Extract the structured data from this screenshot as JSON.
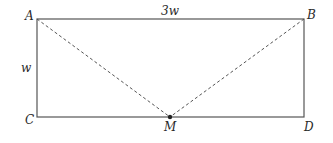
{
  "diagram": {
    "type": "geometry-rectangle",
    "colors": {
      "stroke": "#555555",
      "dashed": "#555555",
      "text": "#2a2a2a",
      "background": "#ffffff"
    },
    "rectangle": {
      "x1": 37,
      "y1": 19,
      "x2": 304,
      "y2": 117
    },
    "points": {
      "A": {
        "label": "A",
        "x": 37,
        "y": 19
      },
      "B": {
        "label": "B",
        "x": 304,
        "y": 19
      },
      "C": {
        "label": "C",
        "x": 37,
        "y": 117
      },
      "D": {
        "label": "D",
        "x": 304,
        "y": 117
      },
      "M": {
        "label": "M",
        "x": 170,
        "y": 117
      }
    },
    "dimensions": {
      "top": "3w",
      "left": "w"
    },
    "segments_dashed": [
      "AM",
      "BM"
    ]
  }
}
